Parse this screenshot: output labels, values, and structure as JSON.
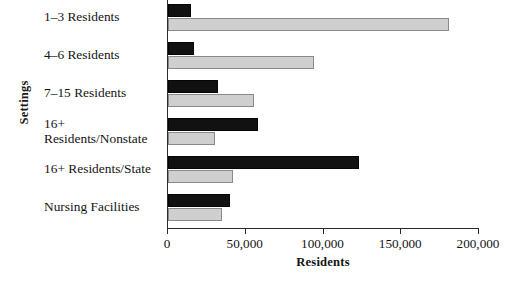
{
  "chart_data": {
    "type": "bar",
    "orientation": "horizontal",
    "title": "",
    "xlabel": "Residents",
    "ylabel": "Settings",
    "xlim": [
      0,
      200000
    ],
    "xticks": [
      0,
      50000,
      100000,
      150000,
      200000
    ],
    "xtick_labels": [
      "0",
      "50,000",
      "100,000",
      "150,000",
      "200,000"
    ],
    "grid": false,
    "legend": "none",
    "categories": [
      "1–3 Residents",
      "4–6 Residents",
      "7–15 Residents",
      "16+\nResidents/Nonstate",
      "16+ Residents/State",
      "Nursing Facilities"
    ],
    "series": [
      {
        "name": "series-dark",
        "color": "#111111",
        "values": [
          15000,
          17000,
          32000,
          58000,
          123000,
          40000
        ]
      },
      {
        "name": "series-light",
        "color": "#cfcfcf",
        "values": [
          181000,
          94000,
          55000,
          30000,
          42000,
          35000
        ]
      }
    ]
  },
  "axis": {
    "y_title": "Settings",
    "x_title": "Residents"
  }
}
